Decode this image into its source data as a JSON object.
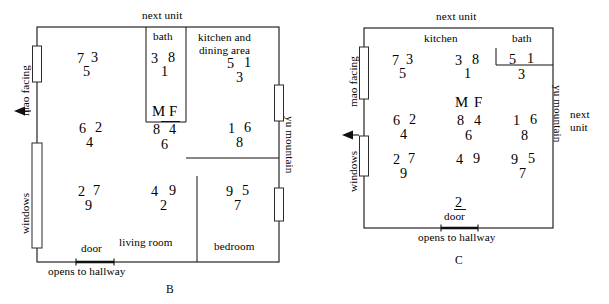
{
  "diagrams": [
    {
      "id": "B",
      "caption": "B",
      "edge_labels": {
        "top": "next unit",
        "left_upper": "mao facing",
        "left_lower": "windows",
        "right": "yu mountain",
        "bottom": "opens to hallway"
      },
      "rooms": [
        {
          "name": "bath",
          "label": "bath"
        },
        {
          "name": "kitchen-and-dining-area",
          "label": "kitchen and\ndining area",
          "label_line1": "kitchen and",
          "label_line2": "dining area"
        },
        {
          "name": "living-room",
          "label": "living room"
        },
        {
          "name": "bedroom",
          "label": "bedroom"
        },
        {
          "name": "door",
          "label": "door"
        }
      ],
      "cells": [
        {
          "name": "cell-nw",
          "top_left": "7",
          "top_right": "3",
          "bottom": "5"
        },
        {
          "name": "cell-n-bath",
          "top_left": "3",
          "top_right": "8",
          "bottom": "1"
        },
        {
          "name": "cell-ne-kitchen",
          "top_left": "5",
          "top_right": "1",
          "bottom": "3"
        },
        {
          "name": "cell-w",
          "top_left": "6",
          "top_right": "2",
          "bottom": "4"
        },
        {
          "name": "cell-center",
          "top_left": "8",
          "top_right": "4",
          "bottom": "6"
        },
        {
          "name": "cell-e",
          "top_left": "1",
          "top_right": "6",
          "bottom": "8"
        },
        {
          "name": "cell-sw",
          "top_left": "2",
          "top_right": "7",
          "bottom": "9"
        },
        {
          "name": "cell-s-living",
          "top_left": "4",
          "top_right": "9",
          "bottom": "2"
        },
        {
          "name": "cell-se-bedroom",
          "top_left": "9",
          "top_right": "5",
          "bottom": "7"
        }
      ],
      "mf_marker": {
        "m": "M",
        "f": "F"
      }
    },
    {
      "id": "C",
      "caption": "C",
      "edge_labels": {
        "top": "next unit",
        "left_upper": "mao facing",
        "left_lower": "windows",
        "right": "yu mountain",
        "right_outer_line1": "next",
        "right_outer_line2": "unit",
        "bottom": "opens to hallway"
      },
      "rooms": [
        {
          "name": "kitchen",
          "label": "kitchen"
        },
        {
          "name": "bath",
          "label": "bath"
        },
        {
          "name": "door",
          "label": "door"
        }
      ],
      "cells": [
        {
          "name": "cell-nw",
          "top_left": "7",
          "top_right": "3",
          "bottom": "5"
        },
        {
          "name": "cell-n",
          "top_left": "3",
          "top_right": "8",
          "bottom": "1"
        },
        {
          "name": "cell-ne-bath",
          "top_left": "5",
          "top_right": "1",
          "bottom": "3"
        },
        {
          "name": "cell-w",
          "top_left": "6",
          "top_right": "2",
          "bottom": "4"
        },
        {
          "name": "cell-center",
          "top_left": "8",
          "top_right": "4",
          "bottom": "6"
        },
        {
          "name": "cell-e",
          "top_left": "1",
          "top_right": "6",
          "bottom": "8"
        },
        {
          "name": "cell-sw",
          "top_left": "2",
          "top_right": "7",
          "bottom": "9"
        },
        {
          "name": "cell-s",
          "top_left": "4",
          "top_right": "9",
          "bottom": "2"
        },
        {
          "name": "cell-se",
          "top_left": "9",
          "top_right": "5",
          "bottom": "7"
        }
      ],
      "mf_marker": {
        "m": "M",
        "f": "F"
      }
    }
  ],
  "colors": {
    "ink": "#111111",
    "paper": "#ffffff"
  }
}
